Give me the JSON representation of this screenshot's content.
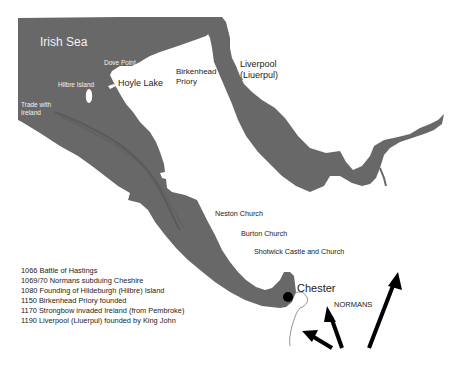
{
  "map": {
    "sea_color": "#686868",
    "trade_route_color": "#5a5a5a",
    "marker_color": "#000000",
    "arrow_color": "#000000"
  },
  "labels": {
    "irish_sea": "Irish Sea",
    "dove_point": "Dove Point",
    "hilbre_island": "Hilbre Island",
    "trade_with_ireland_line1": "Trade with",
    "trade_with_ireland_line2": "Ireland",
    "hoyle_lake": "Hoyle Lake",
    "birkenhead_line1": "Birkenhead",
    "birkenhead_line2": "Priory",
    "liverpool_line1": "Liverpool",
    "liverpool_line2": "(Liuerpul)",
    "neston": "Neston Church",
    "burton": "Burton Church",
    "shotwick": "Shotwick Castle and Church",
    "chester": "Chester",
    "normans": "NORMANS"
  },
  "legend": {
    "items": [
      "1066 Battle of Hastings",
      "1069/70 Normans subduing Cheshire",
      "1080 Founding of Hildeburgh (Hilbre) Island",
      "1150 Birkenhead Priory founded",
      "1170 Strongbow invaded Ireland (from Pembroke)",
      "1190 Liverpool (Liuerpul) founded by King John"
    ]
  }
}
